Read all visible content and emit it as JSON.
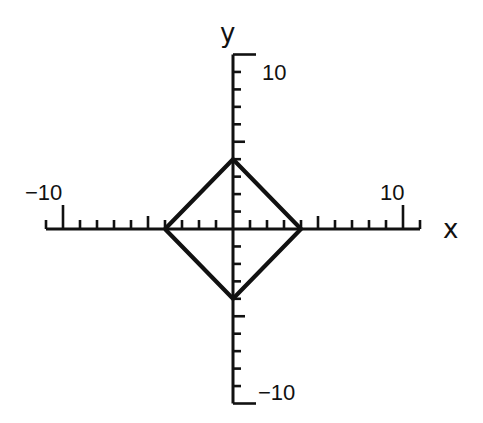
{
  "chart_data": {
    "type": "line",
    "title": "",
    "xlabel": "x",
    "ylabel": "y",
    "xlim": [
      -11,
      11
    ],
    "ylim": [
      -10,
      10
    ],
    "grid": false,
    "legend": null,
    "x_tick_labels": [
      {
        "value": -10,
        "label": "−10"
      },
      {
        "value": 10,
        "label": "10"
      }
    ],
    "y_tick_labels": [
      {
        "value": 10,
        "label": "10"
      },
      {
        "value": -10,
        "label": "−10"
      }
    ],
    "tick_interval": 1,
    "series": [
      {
        "name": "|x| + |y| = 4",
        "x": [
          -4,
          0,
          4,
          0,
          -4
        ],
        "y": [
          0,
          4,
          0,
          -4,
          0
        ]
      }
    ],
    "colors": {
      "ink": "#111111",
      "background": "#ffffff"
    }
  },
  "labels": {
    "x_axis": "x",
    "y_axis": "y",
    "x_min": "−10",
    "x_max": "10",
    "y_max": "10",
    "y_min": "−10"
  }
}
